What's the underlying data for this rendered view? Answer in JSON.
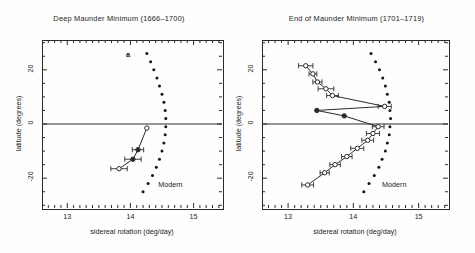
{
  "figure": {
    "x_axis_title": "sidereal rotation (deg/day)",
    "y_axis_title": "latitude (degrees)",
    "modern_label": "Modern",
    "panel_letter": "a"
  },
  "chart_data": [
    {
      "type": "scatter",
      "title": "Deep Maunder Minimum (1666–1700)",
      "xlabel": "sidereal rotation (deg/day)",
      "ylabel": "latitude (degrees)",
      "xlim": [
        12.6,
        15.45
      ],
      "ylim": [
        -31,
        31
      ],
      "xticks": [
        13,
        14,
        15
      ],
      "yticks": [
        20,
        0,
        -20
      ],
      "grid": false,
      "annotations": [
        "Modern",
        "a"
      ],
      "series": [
        {
          "name": "Modern",
          "style": "dotted-curve",
          "x": [
            14.26,
            14.32,
            14.37,
            14.42,
            14.46,
            14.5,
            14.53,
            14.55,
            14.56,
            14.56,
            14.55,
            14.53,
            14.5,
            14.46,
            14.41,
            14.35,
            14.28,
            14.2
          ],
          "y": [
            26.0,
            23.0,
            20.0,
            17.0,
            14.0,
            11.0,
            8.0,
            5.0,
            2.0,
            -1.0,
            -4.0,
            -7.0,
            -10.0,
            -13.0,
            -16.0,
            -19.0,
            -22.0,
            -25.0
          ]
        },
        {
          "name": "Maunder sunspot rotation",
          "style": "line-with-error-bars",
          "x": [
            14.26,
            14.12,
            14.04,
            13.82
          ],
          "y": [
            -1.5,
            -9.5,
            -13.0,
            -16.5
          ],
          "xerr": [
            0.0,
            0.09,
            0.13,
            0.13
          ],
          "symbols": [
            "open",
            "filled",
            "filled",
            "open"
          ]
        }
      ]
    },
    {
      "type": "scatter",
      "title": "End of Maunder Minimum (1701–1719)",
      "xlabel": "sidereal rotation (deg/day)",
      "ylabel": "latitude (degrees)",
      "xlim": [
        12.6,
        15.45
      ],
      "ylim": [
        -31,
        31
      ],
      "xticks": [
        13,
        14,
        15
      ],
      "yticks": [
        20,
        0,
        -20
      ],
      "grid": false,
      "annotations": [
        "Modern"
      ],
      "series": [
        {
          "name": "Modern",
          "style": "dotted-curve",
          "x": [
            14.27,
            14.34,
            14.4,
            14.45,
            14.49,
            14.52,
            14.55,
            14.56,
            14.57,
            14.56,
            14.55,
            14.52,
            14.49,
            14.44,
            14.39,
            14.32,
            14.24,
            14.16
          ],
          "y": [
            26.0,
            23.0,
            20.0,
            17.0,
            14.0,
            11.0,
            8.0,
            5.0,
            2.0,
            -1.0,
            -4.0,
            -7.0,
            -10.0,
            -13.0,
            -16.0,
            -19.0,
            -22.0,
            -25.0
          ]
        },
        {
          "name": "Maunder sunspot rotation",
          "style": "line-with-error-bars",
          "x": [
            13.27,
            13.38,
            13.45,
            13.58,
            13.68,
            14.48,
            13.44,
            13.86,
            14.38,
            14.3,
            14.22,
            14.06,
            13.9,
            13.72,
            13.56,
            13.3
          ],
          "y": [
            21.5,
            18.5,
            15.5,
            13.0,
            10.5,
            6.5,
            5.0,
            3.0,
            -1.0,
            -3.5,
            -6.0,
            -9.0,
            -12.0,
            -15.0,
            -18.0,
            -22.5
          ],
          "xerr": [
            0.11,
            0.06,
            0.07,
            0.12,
            0.09,
            0.1,
            0.0,
            0.0,
            0.09,
            0.1,
            0.09,
            0.1,
            0.08,
            0.08,
            0.07,
            0.09
          ],
          "symbols": [
            "open",
            "open",
            "open",
            "open",
            "open",
            "open",
            "filled",
            "filled",
            "open",
            "open",
            "open",
            "open",
            "open",
            "open",
            "open",
            "open"
          ]
        }
      ]
    }
  ],
  "panels": [
    {
      "id": "left",
      "title": "Deep Maunder Minimum (1666–1700)",
      "letter": "a",
      "modern_label": "Modern",
      "xticks": [
        "13",
        "14",
        "15"
      ],
      "yticks": [
        "20",
        "0",
        "-20"
      ]
    },
    {
      "id": "right",
      "title": "End of Maunder Minimum (1701–1719)",
      "letter": "",
      "modern_label": "Modern",
      "xticks": [
        "13",
        "14",
        "15"
      ],
      "yticks": [
        "20",
        "0",
        "-20"
      ]
    }
  ]
}
